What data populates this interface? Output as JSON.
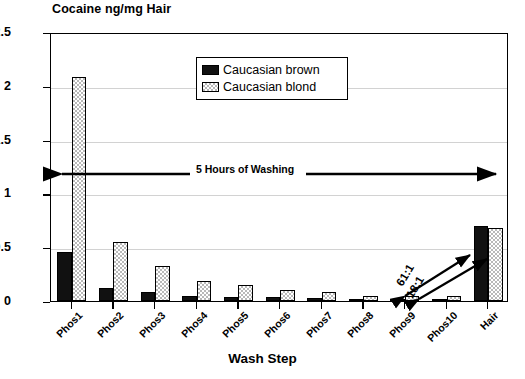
{
  "chart_data": {
    "type": "bar",
    "title": "Cocaine ng/mg Hair",
    "xlabel": "Wash Step",
    "ylabel": "",
    "ylim": [
      0,
      2.5
    ],
    "yticks": [
      "0",
      "0.5",
      "1",
      "1.5",
      "2",
      "2.5"
    ],
    "ytick_values": [
      0,
      0.5,
      1,
      1.5,
      2,
      2.5
    ],
    "grid": "horizontal",
    "legend_position": "upper-center",
    "categories": [
      "Phos1",
      "Phos2",
      "Phos3",
      "Phos4",
      "Phos5",
      "Phos6",
      "Phos7",
      "Phos8",
      "Phos9",
      "Phos10",
      "Hair"
    ],
    "series": [
      {
        "name": "Caucasian brown",
        "fill": "solid-black",
        "color": "#111111",
        "values": [
          0.46,
          0.12,
          0.08,
          0.05,
          0.04,
          0.04,
          0.03,
          0.02,
          0.02,
          0.02,
          0.7
        ]
      },
      {
        "name": "Caucasian blond",
        "fill": "checkered",
        "color": "#b9b9b9",
        "values": [
          2.08,
          0.55,
          0.33,
          0.19,
          0.15,
          0.1,
          0.08,
          0.05,
          0.05,
          0.05,
          0.68
        ]
      }
    ],
    "annotations": [
      {
        "text": "5 Hours of Washing",
        "type": "double-arrow",
        "y_value": 1.2
      },
      {
        "text": "61:1",
        "type": "double-arrow",
        "from": "Phos10",
        "to": "Hair"
      },
      {
        "text": "18:1",
        "type": "double-arrow",
        "from": "Phos10",
        "to": "Hair"
      }
    ]
  },
  "legend": {
    "items": [
      {
        "label": "Caucasian brown"
      },
      {
        "label": "Caucasian blond"
      }
    ]
  }
}
